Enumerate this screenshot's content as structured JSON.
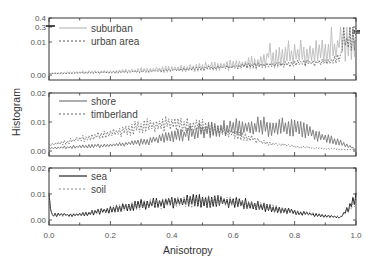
{
  "chart_data": {
    "type": "line",
    "xlabel": "Anisotropy",
    "ylabel": "Histogram",
    "xlim": [
      0.0,
      1.0
    ],
    "x_ticks": [
      "0.0",
      "0.2",
      "0.4",
      "0.6",
      "0.8",
      "1.0"
    ],
    "panels": [
      {
        "id": "top",
        "y_ticks": [
          "0.4",
          "0.3",
          "0.01",
          "0.00"
        ],
        "ylim_note": "broken axis: 0.00-0.01 linear, then 0.3-0.4 at top",
        "legend": [
          {
            "name": "suburban",
            "style": "solid",
            "color": "#bbbbbb"
          },
          {
            "name": "urban area",
            "style": "dotted",
            "color": "#555555"
          }
        ],
        "series": [
          {
            "name": "suburban",
            "x": [
              0.0,
              0.1,
              0.2,
              0.3,
              0.4,
              0.5,
              0.6,
              0.7,
              0.8,
              0.9,
              0.95,
              1.0
            ],
            "values": [
              0.0005,
              0.0008,
              0.001,
              0.0014,
              0.0018,
              0.0025,
              0.003,
              0.004,
              0.006,
              0.007,
              0.008,
              0.3
            ]
          },
          {
            "name": "urban area",
            "x": [
              0.0,
              0.1,
              0.2,
              0.3,
              0.4,
              0.5,
              0.6,
              0.7,
              0.8,
              0.9,
              0.95,
              1.0
            ],
            "values": [
              0.0004,
              0.0006,
              0.0008,
              0.001,
              0.0015,
              0.002,
              0.0025,
              0.003,
              0.0035,
              0.004,
              0.005,
              0.3
            ]
          }
        ]
      },
      {
        "id": "middle",
        "y_ticks": [
          "0.02",
          "0.01",
          "0.00"
        ],
        "ylim": [
          0.0,
          0.02
        ],
        "legend": [
          {
            "name": "shore",
            "style": "solid",
            "color": "#777777"
          },
          {
            "name": "timberland",
            "style": "dotted",
            "color": "#666666"
          }
        ],
        "series": [
          {
            "name": "shore",
            "x": [
              0.0,
              0.1,
              0.2,
              0.3,
              0.4,
              0.5,
              0.6,
              0.7,
              0.8,
              0.9,
              0.95,
              1.0
            ],
            "values": [
              0.001,
              0.0015,
              0.002,
              0.003,
              0.005,
              0.007,
              0.008,
              0.0085,
              0.008,
              0.0045,
              0.003,
              0.0005
            ]
          },
          {
            "name": "timberland",
            "x": [
              0.0,
              0.1,
              0.2,
              0.3,
              0.4,
              0.5,
              0.6,
              0.7,
              0.8,
              0.9,
              0.95,
              1.0
            ],
            "values": [
              0.002,
              0.004,
              0.006,
              0.0085,
              0.0095,
              0.0085,
              0.006,
              0.003,
              0.0015,
              0.0008,
              0.0006,
              0.0004
            ]
          }
        ]
      },
      {
        "id": "bottom",
        "y_ticks": [
          "0.02",
          "0.01",
          "0.00"
        ],
        "ylim": [
          0.0,
          0.02
        ],
        "legend": [
          {
            "name": "sea",
            "style": "solid",
            "color": "#222222"
          },
          {
            "name": "soil",
            "style": "dotted",
            "color": "#888888"
          }
        ],
        "series": [
          {
            "name": "sea",
            "x": [
              0.0,
              0.01,
              0.1,
              0.2,
              0.3,
              0.4,
              0.5,
              0.6,
              0.7,
              0.8,
              0.9,
              0.95,
              1.0
            ],
            "values": [
              0.009,
              0.002,
              0.002,
              0.004,
              0.006,
              0.007,
              0.0075,
              0.007,
              0.005,
              0.003,
              0.0015,
              0.001,
              0.008
            ]
          },
          {
            "name": "soil",
            "x": [
              0.0,
              0.01,
              0.1,
              0.2,
              0.3,
              0.4,
              0.5,
              0.6,
              0.7,
              0.8,
              0.9,
              0.95,
              1.0
            ],
            "values": [
              0.008,
              0.002,
              0.002,
              0.004,
              0.0058,
              0.0068,
              0.0073,
              0.0068,
              0.0052,
              0.0032,
              0.0017,
              0.0012,
              0.007
            ]
          }
        ]
      }
    ]
  }
}
